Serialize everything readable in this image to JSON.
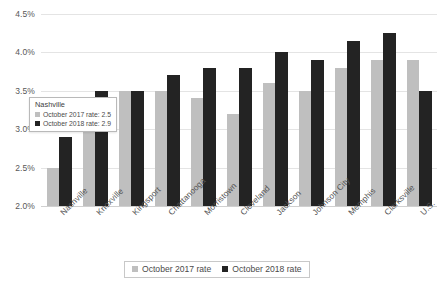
{
  "chart_data": {
    "type": "bar",
    "title": "",
    "xlabel": "",
    "ylabel": "",
    "ylim": [
      2.0,
      4.5
    ],
    "ytick_labels": [
      "4.5%",
      "4.0%",
      "3.5%",
      "3.0%",
      "2.5%",
      "2.0%"
    ],
    "ytick_values": [
      4.5,
      4.0,
      3.5,
      3.0,
      2.5,
      2.0
    ],
    "grid": true,
    "legend_position": "bottom",
    "categories": [
      "Nashville",
      "Knoxville",
      "Kingsport",
      "Chattanooga",
      "Morristown",
      "Cleveland",
      "Jackson",
      "Johnson City",
      "Memphis",
      "Clarksville",
      "U.S."
    ],
    "series": [
      {
        "name": "October 2017 rate",
        "color": "#bfbfbf",
        "values": [
          2.5,
          3.1,
          3.5,
          3.5,
          3.4,
          3.2,
          3.6,
          3.5,
          3.8,
          3.9,
          3.9
        ]
      },
      {
        "name": "October 2018 rate",
        "color": "#232323",
        "values": [
          2.9,
          3.5,
          3.5,
          3.7,
          3.8,
          3.8,
          4.0,
          3.9,
          4.15,
          4.25,
          3.5
        ]
      }
    ]
  },
  "legend": {
    "items": [
      {
        "label": "October 2017 rate"
      },
      {
        "label": "October 2018 rate"
      }
    ]
  },
  "tooltip": {
    "title": "Nashville",
    "rows": [
      {
        "label": "October 2017 rate: 2.5"
      },
      {
        "label": "October 2018 rate: 2.9"
      }
    ]
  }
}
